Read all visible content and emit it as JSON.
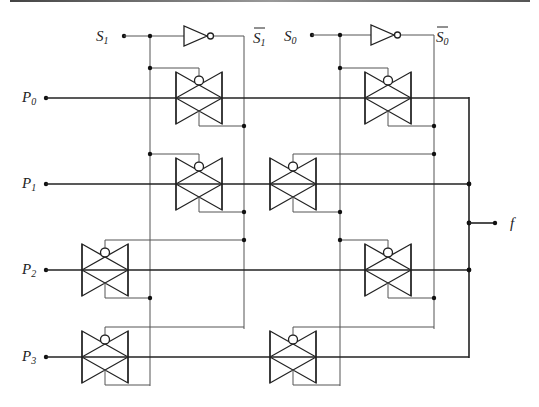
{
  "inputs": {
    "select": [
      {
        "name": "S",
        "sub": "1",
        "bar_name": "S",
        "bar_sub": "1"
      },
      {
        "name": "S",
        "sub": "0",
        "bar_name": "S",
        "bar_sub": "0"
      }
    ],
    "data": [
      {
        "name": "P",
        "sub": "0"
      },
      {
        "name": "P",
        "sub": "1"
      },
      {
        "name": "P",
        "sub": "2"
      },
      {
        "name": "P",
        "sub": "3"
      }
    ]
  },
  "output": {
    "name": "f"
  },
  "components": {
    "inverters": [
      "S1 inverter",
      "S0 inverter"
    ],
    "transmission_gates": [
      {
        "row": "P0",
        "stage": "S1",
        "pmos_ctrl": "S1",
        "nmos_ctrl": "S1-bar"
      },
      {
        "row": "P0",
        "stage": "S0",
        "pmos_ctrl": "S0",
        "nmos_ctrl": "S0-bar"
      },
      {
        "row": "P1",
        "stage": "S1",
        "pmos_ctrl": "S1",
        "nmos_ctrl": "S1-bar"
      },
      {
        "row": "P1",
        "stage": "S0",
        "pmos_ctrl": "S0-bar",
        "nmos_ctrl": "S0"
      },
      {
        "row": "P2",
        "stage": "S1",
        "pmos_ctrl": "S1-bar",
        "nmos_ctrl": "S1"
      },
      {
        "row": "P2",
        "stage": "S0",
        "pmos_ctrl": "S0",
        "nmos_ctrl": "S0-bar"
      },
      {
        "row": "P3",
        "stage": "S1",
        "pmos_ctrl": "S1-bar",
        "nmos_ctrl": "S1"
      },
      {
        "row": "P3",
        "stage": "S0",
        "pmos_ctrl": "S0-bar",
        "nmos_ctrl": "S0"
      }
    ]
  }
}
